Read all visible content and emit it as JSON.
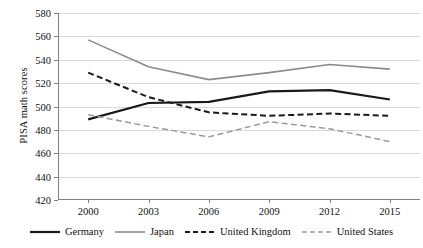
{
  "chart_data": {
    "type": "line",
    "title": "",
    "xlabel": "",
    "ylabel": "PISA math scores",
    "categories": [
      "2000",
      "2003",
      "2006",
      "2009",
      "2012",
      "2015"
    ],
    "ylim": [
      420,
      580
    ],
    "yticks": [
      420,
      440,
      460,
      480,
      500,
      520,
      540,
      560,
      580
    ],
    "grid": true,
    "legend_position": "bottom",
    "series": [
      {
        "name": "Germany",
        "values": [
          489,
          503,
          504,
          513,
          514,
          506
        ],
        "color": "#1a1a1a",
        "style": "solid",
        "width": 2.2
      },
      {
        "name": "Japan",
        "values": [
          557,
          534,
          523,
          529,
          536,
          532
        ],
        "color": "#8c8c8c",
        "style": "solid",
        "width": 1.6
      },
      {
        "name": "United Kingdom",
        "values": [
          529,
          508,
          495,
          492,
          494,
          492
        ],
        "color": "#1a1a1a",
        "style": "dashed",
        "width": 2.0
      },
      {
        "name": "United States",
        "values": [
          493,
          483,
          474,
          487,
          481,
          470
        ],
        "color": "#9a9a9a",
        "style": "dashed",
        "width": 1.5
      }
    ]
  },
  "axis": {
    "y_title": "PISA math scores"
  },
  "legend": {
    "items": [
      {
        "label": "Germany"
      },
      {
        "label": "Japan"
      },
      {
        "label": "United Kingdom"
      },
      {
        "label": "United States"
      }
    ]
  }
}
